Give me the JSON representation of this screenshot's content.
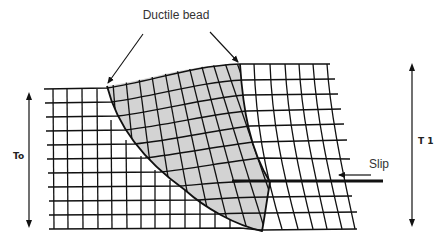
{
  "diagram": {
    "title_label": "Ductile bead",
    "slip_label": "Slip",
    "left_thickness_label": "To",
    "right_thickness_label": "T 1",
    "colors": {
      "line": "#111111",
      "bead_fill": "#d3d3d3",
      "text": "#333333",
      "background": "#ffffff"
    }
  }
}
